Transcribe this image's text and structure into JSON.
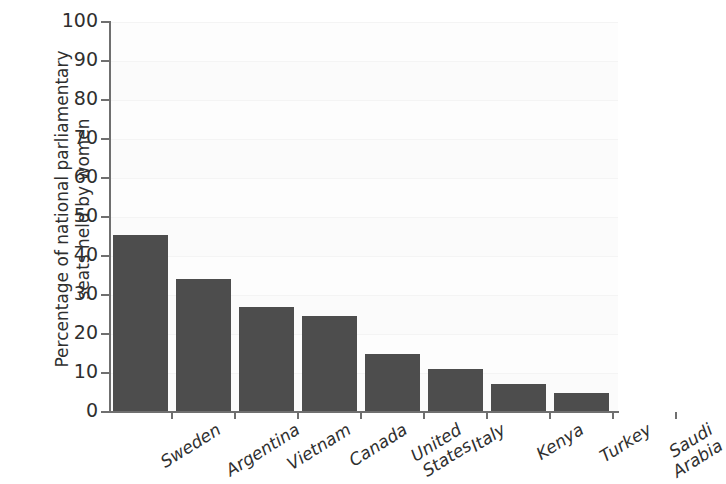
{
  "chart_data": {
    "type": "bar",
    "title": "",
    "subtitle": "",
    "xlabel": "",
    "ylabel": "Percentage of national parliamentary seats held by women",
    "ylabel_lines": [
      "Percentage of national parliamentary",
      "seats held by women"
    ],
    "categories": [
      "Sweden",
      "Argentina",
      "Vietnam",
      "Canada",
      "United States",
      "Italy",
      "Kenya",
      "Turkey",
      "Saudi Arabia"
    ],
    "category_lines": [
      [
        "Sweden"
      ],
      [
        "Argentina"
      ],
      [
        "Vietnam"
      ],
      [
        "Canada"
      ],
      [
        "United",
        "States"
      ],
      [
        "Italy"
      ],
      [
        "Kenya"
      ],
      [
        "Turkey"
      ],
      [
        "Saudi",
        "Arabia"
      ]
    ],
    "values": [
      45.5,
      34,
      27,
      24.5,
      14.8,
      11,
      7.2,
      5,
      0
    ],
    "ylim": [
      0,
      100
    ],
    "ytick_values": [
      0,
      10,
      20,
      30,
      40,
      50,
      60,
      70,
      80,
      90,
      100
    ],
    "ytick_labels": [
      "0",
      "10",
      "20",
      "30",
      "40",
      "50",
      "60",
      "70",
      "80",
      "90",
      "100"
    ],
    "grid": "horizontal-faint",
    "legend": "none",
    "bar_color": "#4d4d4d",
    "axis_color": "#6f6f6f",
    "plot_background": "#fdfdfd"
  }
}
